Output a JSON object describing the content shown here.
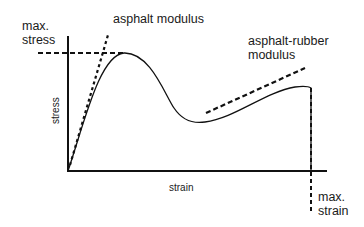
{
  "diagram": {
    "title": "",
    "labels": {
      "max_stress_line1": "max.",
      "max_stress_line2": "stress",
      "asphalt_modulus": "asphalt modulus",
      "asphalt_rubber_line1": "asphalt-rubber",
      "asphalt_rubber_line2": "modulus",
      "y_axis": "stress",
      "x_axis": "strain",
      "max_strain_line1": "max.",
      "max_strain_line2": "strain"
    },
    "colors": {
      "stroke": "#111111",
      "background": "#ffffff"
    },
    "elements": [
      {
        "id": "y-axis",
        "type": "solid-line",
        "from": [
          68,
          36
        ],
        "to": [
          68,
          171
        ]
      },
      {
        "id": "x-axis",
        "type": "solid-line",
        "from": [
          68,
          171
        ],
        "to": [
          327,
          171
        ]
      },
      {
        "id": "max-stress-line",
        "type": "dashed-line",
        "from": [
          38,
          53
        ],
        "to": [
          125,
          53
        ]
      },
      {
        "id": "asphalt-modulus-tangent",
        "type": "dashed-line",
        "from": [
          70,
          165
        ],
        "to": [
          108,
          35
        ]
      },
      {
        "id": "asphalt-rubber-modulus-tangent",
        "type": "dashed-line",
        "from": [
          206,
          113
        ],
        "to": [
          305,
          68
        ]
      },
      {
        "id": "max-strain-line",
        "type": "dashed-line",
        "from": [
          311,
          87
        ],
        "to": [
          311,
          212
        ]
      },
      {
        "id": "stress-strain-curve",
        "type": "curve",
        "points": [
          [
            68,
            171
          ],
          [
            124,
            53
          ],
          [
            205,
            122
          ],
          [
            310,
            87
          ],
          [
            312,
            171
          ]
        ]
      }
    ]
  }
}
